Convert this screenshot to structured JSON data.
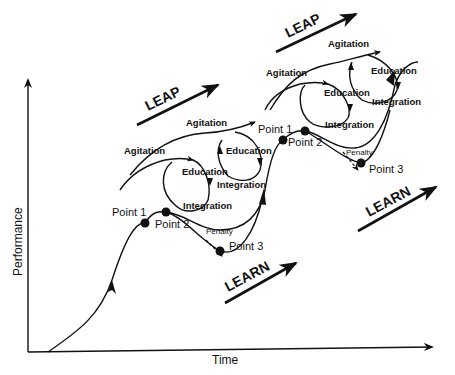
{
  "axes": {
    "x_label": "Time",
    "y_label": "Performance"
  },
  "cycle1": {
    "leap_label": "LEAP",
    "learn_label": "LEARN",
    "agitation_outer": "Agitation",
    "agitation_inner": "Agitation",
    "education_left": "Education",
    "education_right": "Education",
    "integration_left": "Integration",
    "integration_right": "Integration",
    "point1": "Point 1",
    "point2": "Point 2",
    "point3": "Point 3",
    "penalty": "Penalty"
  },
  "cycle2": {
    "leap_label": "LEAP",
    "learn_label": "LEARN",
    "agitation_outer": "Agitation",
    "agitation_inner": "Agitation",
    "education_left": "Education",
    "education_right": "Education",
    "integration_left": "Integration",
    "integration_right": "Integration",
    "point1": "Point 1",
    "point2": "Point 2",
    "point3": "Point 3",
    "penalty": "Penalty"
  }
}
